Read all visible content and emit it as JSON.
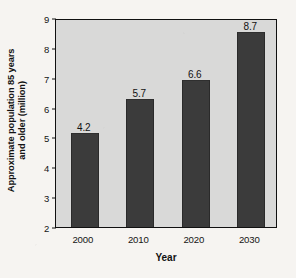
{
  "chart_data": {
    "type": "bar",
    "title": "",
    "subtitle": "",
    "xlabel": "Year",
    "ylabel_line1": "Approximate population 85 years",
    "ylabel_line2": "and older (million)",
    "ylabel": "Approximate population 85 years and older (million)",
    "categories": [
      "2000",
      "2010",
      "2020",
      "2030"
    ],
    "values": [
      4.2,
      5.7,
      6.6,
      8.7
    ],
    "value_labels": [
      "4.2",
      "5.7",
      "6.6",
      "8.7"
    ],
    "drawn_bar_tops": [
      5.1,
      6.25,
      6.9,
      8.5
    ],
    "ylim": [
      2,
      9
    ],
    "yticks": [
      "9",
      "8",
      "7",
      "6",
      "5",
      "4",
      "3",
      "2"
    ],
    "ytick_values": [
      9,
      8,
      7,
      6,
      5,
      4,
      3,
      2
    ],
    "grid": false,
    "legend": null,
    "legend_position": "none",
    "colors": {
      "bar": "#3b3b3b",
      "plot_background": "#d9d9d8",
      "page_background": "#f6f4f1",
      "axis": "#101010",
      "text": "#121212"
    }
  }
}
